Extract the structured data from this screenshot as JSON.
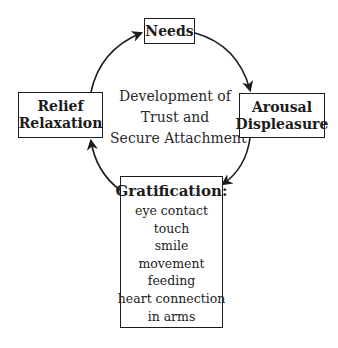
{
  "diagram": {
    "type": "cycle",
    "center_label": [
      "Development of",
      "Trust and",
      "Secure Attachment"
    ],
    "nodes": {
      "needs": {
        "title": [
          "Needs"
        ]
      },
      "arousal": {
        "title": [
          "Arousal",
          "Displeasure"
        ]
      },
      "gratification": {
        "title": "Gratification:",
        "items": [
          "eye contact",
          "touch",
          "smile",
          "movement",
          "feeding",
          "heart connection",
          "in arms"
        ]
      },
      "relief": {
        "title": [
          "Relief",
          "Relaxation"
        ]
      }
    },
    "edges": [
      {
        "from": "needs",
        "to": "arousal"
      },
      {
        "from": "arousal",
        "to": "gratification"
      },
      {
        "from": "gratification",
        "to": "relief"
      },
      {
        "from": "relief",
        "to": "needs"
      }
    ],
    "colors": {
      "stroke": "#1c1c1c",
      "background": "#ffffff"
    }
  }
}
